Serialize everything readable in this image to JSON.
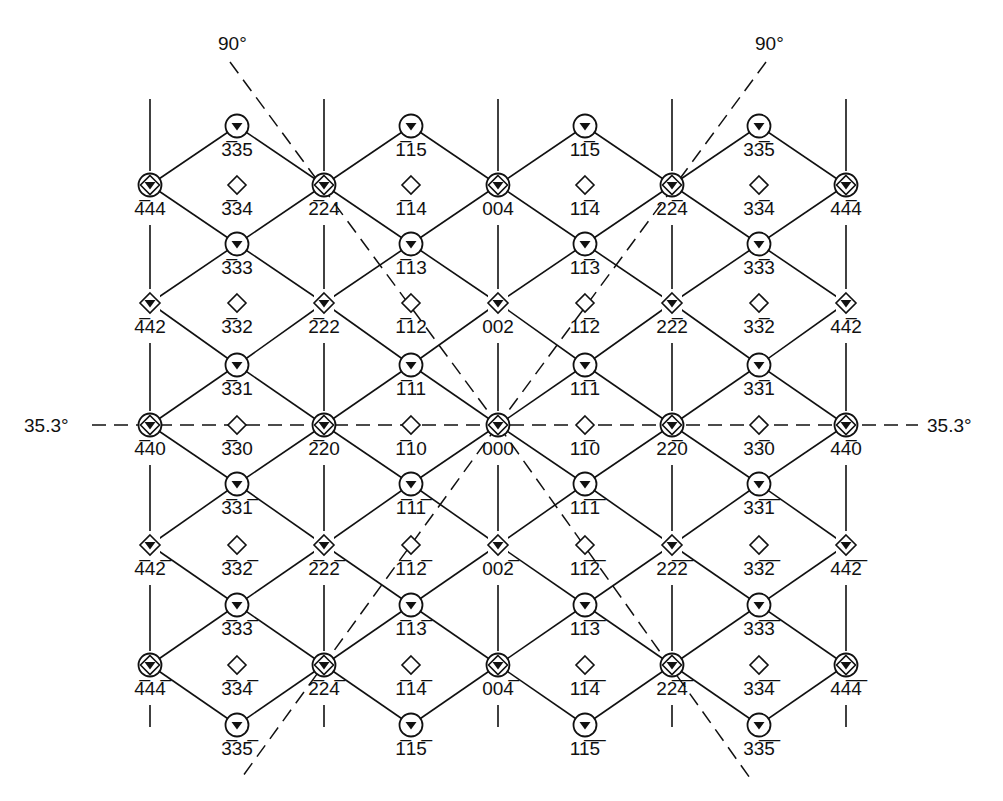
{
  "figure": {
    "type": "electron diffraction pattern (zone axis), indexed reciprocal lattice",
    "colors": {
      "ink": "#111111",
      "background": "#ffffff"
    },
    "angles": [
      {
        "label": "90°",
        "position": "top-left",
        "x": 238,
        "y": 48
      },
      {
        "label": "90°",
        "position": "top-right",
        "x": 775,
        "y": 48
      },
      {
        "label": "35.3°",
        "position": "left",
        "x": 68,
        "y": 432
      },
      {
        "label": "35.3°",
        "position": "right",
        "x": 950,
        "y": 432
      }
    ],
    "columns_x": [
      150,
      237,
      324,
      411,
      498,
      585,
      672,
      759,
      846
    ],
    "rows_y": {
      "5": 126,
      "4": 185,
      "3": 244,
      "2": 303,
      "1": 365,
      "0": 425,
      "-1": 484,
      "-2": 545,
      "-3": 605,
      "-4": 665,
      "-5": 725
    },
    "legend": {
      "double-ring": "strong fundamental reflection (circle + diamond + triangle)",
      "diamond-triangle": "reflection (diamond + triangle)",
      "circle-triangle": "reflection (circle + triangle)",
      "open-diamond": "forbidden / extinct position"
    },
    "nodes": [
      {
        "col": 0,
        "l": 4,
        "kind": "double-ring",
        "label": "4̅44"
      },
      {
        "col": 2,
        "l": 4,
        "kind": "double-ring",
        "label": "2̅24"
      },
      {
        "col": 4,
        "l": 4,
        "kind": "double-ring",
        "label": "004"
      },
      {
        "col": 6,
        "l": 4,
        "kind": "double-ring",
        "label": "22̅4"
      },
      {
        "col": 8,
        "l": 4,
        "kind": "double-ring",
        "label": "44̅4"
      },
      {
        "col": 0,
        "l": 2,
        "kind": "diamond-triangle",
        "label": "4̅42"
      },
      {
        "col": 2,
        "l": 2,
        "kind": "diamond-triangle",
        "label": "2̅22"
      },
      {
        "col": 4,
        "l": 2,
        "kind": "diamond-triangle",
        "label": "002"
      },
      {
        "col": 6,
        "l": 2,
        "kind": "diamond-triangle",
        "label": "22̅2"
      },
      {
        "col": 8,
        "l": 2,
        "kind": "diamond-triangle",
        "label": "44̅2"
      },
      {
        "col": 0,
        "l": 0,
        "kind": "double-ring",
        "label": "4̅40"
      },
      {
        "col": 2,
        "l": 0,
        "kind": "double-ring",
        "label": "2̅20"
      },
      {
        "col": 4,
        "l": 0,
        "kind": "double-ring",
        "label": "000"
      },
      {
        "col": 6,
        "l": 0,
        "kind": "double-ring",
        "label": "22̅0"
      },
      {
        "col": 8,
        "l": 0,
        "kind": "double-ring",
        "label": "44̅0"
      },
      {
        "col": 0,
        "l": -2,
        "kind": "diamond-triangle",
        "label": "4̅42̅"
      },
      {
        "col": 2,
        "l": -2,
        "kind": "diamond-triangle",
        "label": "2̅22̅"
      },
      {
        "col": 4,
        "l": -2,
        "kind": "diamond-triangle",
        "label": "002̅"
      },
      {
        "col": 6,
        "l": -2,
        "kind": "diamond-triangle",
        "label": "22̅2̅"
      },
      {
        "col": 8,
        "l": -2,
        "kind": "diamond-triangle",
        "label": "44̅2̅"
      },
      {
        "col": 0,
        "l": -4,
        "kind": "double-ring",
        "label": "4̅44̅"
      },
      {
        "col": 2,
        "l": -4,
        "kind": "double-ring",
        "label": "2̅24̅"
      },
      {
        "col": 4,
        "l": -4,
        "kind": "double-ring",
        "label": "004̅"
      },
      {
        "col": 6,
        "l": -4,
        "kind": "double-ring",
        "label": "22̅4̅"
      },
      {
        "col": 8,
        "l": -4,
        "kind": "double-ring",
        "label": "44̅4̅"
      },
      {
        "col": 1,
        "l": 5,
        "kind": "circle-triangle",
        "label": "3̅35"
      },
      {
        "col": 3,
        "l": 5,
        "kind": "circle-triangle",
        "label": "1̅15"
      },
      {
        "col": 5,
        "l": 5,
        "kind": "circle-triangle",
        "label": "11̅5"
      },
      {
        "col": 7,
        "l": 5,
        "kind": "circle-triangle",
        "label": "33̅5"
      },
      {
        "col": 1,
        "l": 4,
        "kind": "open-diamond",
        "label": "3̅34"
      },
      {
        "col": 3,
        "l": 4,
        "kind": "open-diamond",
        "label": "1̅14"
      },
      {
        "col": 5,
        "l": 4,
        "kind": "open-diamond",
        "label": "11̅4"
      },
      {
        "col": 7,
        "l": 4,
        "kind": "open-diamond",
        "label": "33̅4"
      },
      {
        "col": 1,
        "l": 3,
        "kind": "circle-triangle",
        "label": "3̅33"
      },
      {
        "col": 3,
        "l": 3,
        "kind": "circle-triangle",
        "label": "1̅13"
      },
      {
        "col": 5,
        "l": 3,
        "kind": "circle-triangle",
        "label": "11̅3"
      },
      {
        "col": 7,
        "l": 3,
        "kind": "circle-triangle",
        "label": "33̅3"
      },
      {
        "col": 1,
        "l": 2,
        "kind": "open-diamond",
        "label": "3̅32"
      },
      {
        "col": 3,
        "l": 2,
        "kind": "open-diamond",
        "label": "1̅12"
      },
      {
        "col": 5,
        "l": 2,
        "kind": "open-diamond",
        "label": "11̅2"
      },
      {
        "col": 7,
        "l": 2,
        "kind": "open-diamond",
        "label": "33̅2"
      },
      {
        "col": 1,
        "l": 1,
        "kind": "circle-triangle",
        "label": "3̅31"
      },
      {
        "col": 3,
        "l": 1,
        "kind": "circle-triangle",
        "label": "1̅11"
      },
      {
        "col": 5,
        "l": 1,
        "kind": "circle-triangle",
        "label": "11̅1"
      },
      {
        "col": 7,
        "l": 1,
        "kind": "circle-triangle",
        "label": "33̅1"
      },
      {
        "col": 1,
        "l": 0,
        "kind": "open-diamond",
        "label": "3̅30"
      },
      {
        "col": 3,
        "l": 0,
        "kind": "open-diamond",
        "label": "1̅10"
      },
      {
        "col": 5,
        "l": 0,
        "kind": "open-diamond",
        "label": "11̅0"
      },
      {
        "col": 7,
        "l": 0,
        "kind": "open-diamond",
        "label": "33̅0"
      },
      {
        "col": 1,
        "l": -1,
        "kind": "circle-triangle",
        "label": "3̅31̅"
      },
      {
        "col": 3,
        "l": -1,
        "kind": "circle-triangle",
        "label": "1̅11̅"
      },
      {
        "col": 5,
        "l": -1,
        "kind": "circle-triangle",
        "label": "11̅1̅"
      },
      {
        "col": 7,
        "l": -1,
        "kind": "circle-triangle",
        "label": "33̅1̅"
      },
      {
        "col": 1,
        "l": -2,
        "kind": "open-diamond",
        "label": "3̅32̅"
      },
      {
        "col": 3,
        "l": -2,
        "kind": "open-diamond",
        "label": "1̅12̅"
      },
      {
        "col": 5,
        "l": -2,
        "kind": "open-diamond",
        "label": "11̅2̅"
      },
      {
        "col": 7,
        "l": -2,
        "kind": "open-diamond",
        "label": "33̅2̅"
      },
      {
        "col": 1,
        "l": -3,
        "kind": "circle-triangle",
        "label": "3̅33̅"
      },
      {
        "col": 3,
        "l": -3,
        "kind": "circle-triangle",
        "label": "1̅13̅"
      },
      {
        "col": 5,
        "l": -3,
        "kind": "circle-triangle",
        "label": "11̅3̅"
      },
      {
        "col": 7,
        "l": -3,
        "kind": "circle-triangle",
        "label": "33̅3̅"
      },
      {
        "col": 1,
        "l": -4,
        "kind": "open-diamond",
        "label": "3̅34̅"
      },
      {
        "col": 3,
        "l": -4,
        "kind": "open-diamond",
        "label": "1̅14̅"
      },
      {
        "col": 5,
        "l": -4,
        "kind": "open-diamond",
        "label": "11̅4̅"
      },
      {
        "col": 7,
        "l": -4,
        "kind": "open-diamond",
        "label": "33̅4̅"
      },
      {
        "col": 1,
        "l": -5,
        "kind": "circle-triangle",
        "label": "3̅35̅"
      },
      {
        "col": 3,
        "l": -5,
        "kind": "circle-triangle",
        "label": "1̅15̅"
      },
      {
        "col": 5,
        "l": -5,
        "kind": "circle-triangle",
        "label": "11̅5̅"
      },
      {
        "col": 7,
        "l": -5,
        "kind": "circle-triangle",
        "label": "33̅5̅"
      }
    ],
    "dashed_lines": [
      {
        "name": "horizontal-35.3-line",
        "x1": 92,
        "y1": 425,
        "x2": 918,
        "y2": 425
      },
      {
        "name": "diag-90-topleft",
        "x1": 230,
        "y1": 62,
        "x2": 498,
        "y2": 425
      },
      {
        "name": "diag-90-topright",
        "x1": 766,
        "y1": 62,
        "x2": 498,
        "y2": 425
      },
      {
        "name": "diag-to-bottomleft",
        "x1": 498,
        "y1": 425,
        "x2": 240,
        "y2": 780
      },
      {
        "name": "diag-to-bottomright",
        "x1": 498,
        "y1": 425,
        "x2": 750,
        "y2": 778
      }
    ]
  }
}
